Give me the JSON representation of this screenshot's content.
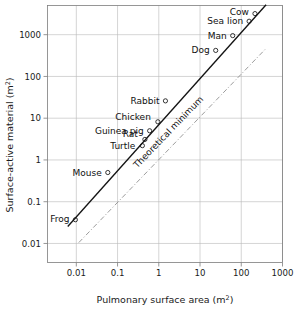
{
  "chart_data": {
    "type": "scatter",
    "title": "",
    "xlabel": "Pulmonary surface area (m2)",
    "xlabel_base": "Pulmonary surface area (m",
    "xlabel_sup": "2",
    "xlabel_tail": ")",
    "ylabel": "Surface-active material (m2)",
    "ylabel_base": "Surface-active material (m",
    "ylabel_sup": "2",
    "ylabel_tail": ")",
    "xscale": "log",
    "yscale": "log",
    "xlim": [
      0.002,
      1000
    ],
    "ylim": [
      0.0035,
      5000
    ],
    "xticks": [
      "0.01",
      "0.1",
      "1",
      "10",
      "100",
      "1000"
    ],
    "xtick_values": [
      0.01,
      0.1,
      1,
      10,
      100,
      1000
    ],
    "yticks": [
      "0.01",
      "0.1",
      "1",
      "10",
      "100",
      "1000"
    ],
    "ytick_values": [
      0.01,
      0.1,
      1,
      10,
      100,
      1000
    ],
    "grid": true,
    "legend": "none",
    "points": [
      {
        "name": "Frog",
        "x": 0.0095,
        "y": 0.037,
        "label_dx": -6,
        "label_dy": 2,
        "anchor": "end"
      },
      {
        "name": "Mouse",
        "x": 0.058,
        "y": 0.5,
        "label_dx": -6,
        "label_dy": 3,
        "anchor": "end"
      },
      {
        "name": "Turtle",
        "x": 0.4,
        "y": 2.2,
        "label_dx": -7,
        "label_dy": 3,
        "anchor": "end"
      },
      {
        "name": "Rat",
        "x": 0.46,
        "y": 3.1,
        "label_dx": -7,
        "label_dy": -2,
        "anchor": "end"
      },
      {
        "name": "Guinea pig",
        "x": 0.6,
        "y": 5.0,
        "label_dx": -6,
        "label_dy": 3,
        "anchor": "end"
      },
      {
        "name": "Chicken",
        "x": 0.95,
        "y": 8.2,
        "label_dx": -7,
        "label_dy": -2,
        "anchor": "end"
      },
      {
        "name": "Rabbit",
        "x": 1.45,
        "y": 26.0,
        "label_dx": -6,
        "label_dy": 3,
        "anchor": "end"
      },
      {
        "name": "Dog",
        "x": 24.0,
        "y": 420.0,
        "label_dx": -6,
        "label_dy": 3,
        "anchor": "end"
      },
      {
        "name": "Man",
        "x": 62.0,
        "y": 950.0,
        "label_dx": -6,
        "label_dy": 3,
        "anchor": "end"
      },
      {
        "name": "Sea lion",
        "x": 155.0,
        "y": 2100.0,
        "label_dx": -6,
        "label_dy": 3,
        "anchor": "end"
      },
      {
        "name": "Cow",
        "x": 215.0,
        "y": 3200.0,
        "label_dx": -6,
        "label_dy": 1,
        "anchor": "end"
      }
    ],
    "lines": [
      {
        "name": "regression-line",
        "style": "solid",
        "x_start": 0.0062,
        "y_start": 0.0255,
        "x_end": 400.0,
        "y_end": 5200.0
      },
      {
        "name": "theoretical-minimum-line",
        "style": "dash-dot",
        "label": "Theoretical minimum",
        "x_start": 0.0115,
        "y_start": 0.0105,
        "x_end": 400.0,
        "y_end": 470.0
      }
    ],
    "colors": {
      "axis": "#7d7d7d",
      "grid": "#b9b9b9",
      "text": "#1a1a1a",
      "line_main": "#141414",
      "line_theoretical": "#8a8a8a",
      "background": "#ffffff"
    }
  }
}
